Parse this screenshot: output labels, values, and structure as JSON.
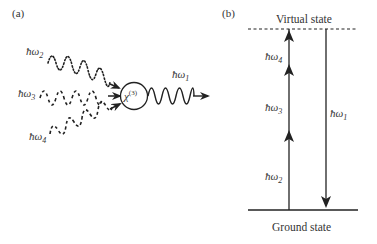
{
  "panel_a": {
    "label": "(a)",
    "inputs": [
      {
        "name": "omega2",
        "label_main": "ħω",
        "label_sub": "2",
        "style": "dotted"
      },
      {
        "name": "omega3",
        "label_main": "ħω",
        "label_sub": "3",
        "style": "dashed"
      },
      {
        "name": "omega4",
        "label_main": "ħω",
        "label_sub": "4",
        "style": "dashed"
      }
    ],
    "medium": {
      "label_main": "χ",
      "label_sup": "(3)"
    },
    "output": {
      "label_main": "ħω",
      "label_sub": "1",
      "style": "solid"
    }
  },
  "panel_b": {
    "label": "(b)",
    "top_level": "Virtual state",
    "bottom_level": "Ground state",
    "up_transitions": [
      {
        "label_main": "ħω",
        "label_sub": "4"
      },
      {
        "label_main": "ħω",
        "label_sub": "3"
      },
      {
        "label_main": "ħω",
        "label_sub": "2"
      }
    ],
    "down_transition": {
      "label_main": "ħω",
      "label_sub": "1"
    }
  },
  "colors": {
    "stroke": "#222222",
    "text": "#333333",
    "background": "#ffffff"
  }
}
